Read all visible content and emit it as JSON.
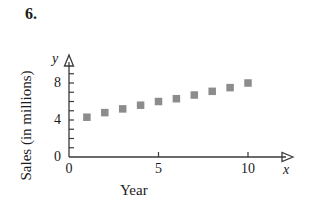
{
  "problem": {
    "number": "6."
  },
  "chart_data": {
    "type": "scatter",
    "title": "",
    "xlabel": "Year",
    "ylabel": "Sales (in millions)",
    "x_var": "x",
    "y_var": "y",
    "x": [
      1,
      2,
      3,
      4,
      5,
      6,
      7,
      8,
      9,
      10
    ],
    "values": [
      4.3,
      4.8,
      5.2,
      5.6,
      6.0,
      6.3,
      6.7,
      7.1,
      7.5,
      8.0
    ],
    "series": [
      {
        "name": "Sales",
        "values": [
          4.3,
          4.8,
          5.2,
          5.6,
          6.0,
          6.3,
          6.7,
          7.1,
          7.5,
          8.0
        ]
      }
    ],
    "xlim": [
      0,
      11.5
    ],
    "ylim": [
      0,
      10
    ],
    "x_tick_values": [
      0,
      5,
      10
    ],
    "x_tick_labels": [
      "0",
      "5",
      "10"
    ],
    "x_minor_tick_values": [
      5,
      10
    ],
    "y_tick_values": [
      0,
      4,
      8
    ],
    "y_tick_labels": [
      "0",
      "4",
      "8"
    ],
    "y_minor_tick_values": [
      1,
      2,
      3,
      4,
      5,
      6,
      7,
      8,
      9
    ],
    "grid": false,
    "legend": null,
    "marker": "square",
    "marker_color": "#8c8c8c",
    "axis_color": "#3a3a3a",
    "axis_arrows": true
  },
  "colors": {
    "marker": "#8c8c8c",
    "axis": "#3a3a3a",
    "text": "#1a1a1a",
    "background": "#ffffff"
  }
}
